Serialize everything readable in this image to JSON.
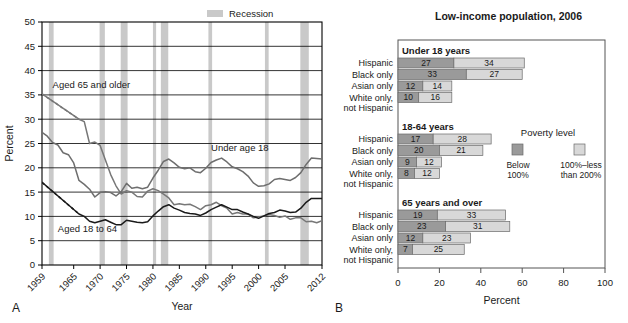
{
  "panel_a": {
    "letter": "A",
    "chart_data": {
      "type": "line",
      "title": "",
      "xlabel": "Year",
      "ylabel": "Percent",
      "ylim": [
        0,
        50
      ],
      "ytick_step": 5,
      "xlim": [
        1959,
        2012
      ],
      "grid": true,
      "xticks": [
        "1959",
        "1965",
        "1970",
        "1975",
        "1980",
        "1985",
        "1990",
        "1995",
        "2000",
        "2005",
        "2012"
      ],
      "xtick_values": [
        1959,
        1965,
        1970,
        1975,
        1980,
        1985,
        1990,
        1995,
        2000,
        2005,
        2012
      ],
      "yticks": [
        0,
        5,
        10,
        15,
        20,
        25,
        30,
        35,
        40,
        45,
        50
      ],
      "legend": [
        {
          "label": "Recession",
          "color": "#c9c9c9"
        }
      ],
      "annotations": [
        {
          "text": "Aged 65 and older",
          "x": 1961,
          "y": 36.5
        },
        {
          "text": "Under age 18",
          "x": 1991,
          "y": 23.5
        },
        {
          "text": "Aged 18 to 64",
          "x": 1962,
          "y": 6.8
        }
      ],
      "recessions": [
        {
          "start": 1960.3,
          "end": 1961.2
        },
        {
          "start": 1969.9,
          "end": 1970.9
        },
        {
          "start": 1973.9,
          "end": 1975.2
        },
        {
          "start": 1980.0,
          "end": 1980.6
        },
        {
          "start": 1981.5,
          "end": 1982.9
        },
        {
          "start": 1990.5,
          "end": 1991.2
        },
        {
          "start": 2001.2,
          "end": 2001.9
        },
        {
          "start": 2007.9,
          "end": 2009.5
        }
      ],
      "series": [
        {
          "name": "Aged 65 and older",
          "color": "#777777",
          "dashed_segments": [
            [
              1959,
              35.2
            ],
            [
              1966,
              30.0
            ]
          ],
          "x": [
            1959,
            1966,
            1967,
            1968,
            1969,
            1970,
            1971,
            1972,
            1973,
            1974,
            1975,
            1976,
            1977,
            1978,
            1979,
            1980,
            1981,
            1982,
            1983,
            1984,
            1985,
            1986,
            1987,
            1988,
            1989,
            1990,
            1991,
            1992,
            1993,
            1994,
            1995,
            1996,
            1997,
            1998,
            1999,
            2000,
            2001,
            2002,
            2003,
            2004,
            2005,
            2006,
            2007,
            2008,
            2009,
            2010,
            2011,
            2012
          ],
          "y": [
            35.2,
            30.0,
            29.5,
            25.0,
            25.3,
            24.6,
            21.6,
            18.6,
            16.3,
            14.6,
            15.3,
            15.0,
            14.1,
            14.0,
            15.2,
            15.7,
            15.3,
            14.6,
            13.8,
            12.4,
            12.6,
            12.4,
            12.5,
            12.0,
            11.4,
            12.2,
            12.4,
            12.9,
            12.2,
            11.7,
            10.5,
            10.8,
            10.5,
            10.5,
            9.7,
            9.9,
            10.1,
            10.4,
            10.2,
            9.8,
            10.1,
            9.4,
            9.7,
            9.7,
            8.9,
            9.0,
            8.7,
            9.1
          ]
        },
        {
          "name": "Under age 18",
          "color": "#6e6e6e",
          "x": [
            1959,
            1960,
            1961,
            1962,
            1963,
            1964,
            1965,
            1966,
            1967,
            1968,
            1969,
            1970,
            1971,
            1972,
            1973,
            1974,
            1975,
            1976,
            1977,
            1978,
            1979,
            1980,
            1981,
            1982,
            1983,
            1984,
            1985,
            1986,
            1987,
            1988,
            1989,
            1990,
            1991,
            1992,
            1993,
            1994,
            1995,
            1996,
            1997,
            1998,
            1999,
            2000,
            2001,
            2002,
            2003,
            2004,
            2005,
            2006,
            2007,
            2008,
            2009,
            2010,
            2011,
            2012
          ],
          "y": [
            27.3,
            26.5,
            25.2,
            24.7,
            23.1,
            22.7,
            21.0,
            17.4,
            16.6,
            15.6,
            14.0,
            14.9,
            15.1,
            14.9,
            14.2,
            15.1,
            16.8,
            15.8,
            16.0,
            15.7,
            16.0,
            17.9,
            19.5,
            21.3,
            21.8,
            21.0,
            20.1,
            19.8,
            20.0,
            19.2,
            19.0,
            19.9,
            21.1,
            21.6,
            22.0,
            21.2,
            20.2,
            19.8,
            19.2,
            18.3,
            16.9,
            16.2,
            16.3,
            16.7,
            17.6,
            17.8,
            17.6,
            17.4,
            18.0,
            19.0,
            20.7,
            22.0,
            21.9,
            21.8
          ]
        },
        {
          "name": "Aged 18 to 64",
          "color": "#1a1a1a",
          "dashed_segments": [
            [
              1959,
              17.0
            ],
            [
              1966,
              10.5
            ]
          ],
          "x": [
            1959,
            1966,
            1967,
            1968,
            1969,
            1970,
            1971,
            1972,
            1973,
            1974,
            1975,
            1976,
            1977,
            1978,
            1979,
            1980,
            1981,
            1982,
            1983,
            1984,
            1985,
            1986,
            1987,
            1988,
            1989,
            1990,
            1991,
            1992,
            1993,
            1994,
            1995,
            1996,
            1997,
            1998,
            1999,
            2000,
            2001,
            2002,
            2003,
            2004,
            2005,
            2006,
            2007,
            2008,
            2009,
            2010,
            2011,
            2012
          ],
          "y": [
            17.0,
            10.5,
            10.0,
            9.0,
            8.7,
            9.0,
            9.3,
            8.8,
            8.3,
            8.3,
            9.2,
            9.0,
            8.8,
            8.7,
            8.9,
            10.1,
            11.1,
            12.0,
            12.4,
            11.7,
            11.3,
            10.8,
            10.6,
            10.5,
            10.2,
            10.7,
            11.4,
            11.9,
            12.4,
            11.9,
            11.4,
            11.4,
            10.9,
            10.5,
            10.0,
            9.6,
            10.1,
            10.6,
            10.8,
            11.3,
            11.1,
            10.8,
            10.9,
            11.7,
            12.9,
            13.7,
            13.7,
            13.7
          ]
        }
      ]
    }
  },
  "panel_b": {
    "letter": "B",
    "chart_data": {
      "type": "bar",
      "title": "Low-income population, 2006",
      "xlabel": "Percent",
      "ylabel": "",
      "xlim": [
        0,
        100
      ],
      "xticks": [
        0,
        20,
        40,
        60,
        80,
        100
      ],
      "xtick_labels": [
        "0",
        "20",
        "40",
        "60",
        "80",
        "100"
      ],
      "orientation": "horizontal",
      "stacked": true,
      "grid": false,
      "legend": {
        "title": "Poverty level",
        "entries": [
          {
            "label": "Below 100%",
            "color": "#9a9a9a"
          },
          {
            "label": "100%–less than 200%",
            "color": "#d8d8d8"
          }
        ]
      },
      "groups": [
        {
          "label": "Under 18 years",
          "categories": [
            "Hispanic",
            "Black only",
            "Asian only",
            "White only, not Hispanic"
          ],
          "series": [
            {
              "name": "Below 100%",
              "values": [
                27,
                33,
                12,
                10
              ]
            },
            {
              "name": "100%–less than 200%",
              "values": [
                34,
                27,
                14,
                16
              ]
            }
          ]
        },
        {
          "label": "18-64 years",
          "categories": [
            "Hispanic",
            "Black only",
            "Asian only",
            "White only, not Hispanic"
          ],
          "series": [
            {
              "name": "Below 100%",
              "values": [
                17,
                20,
                9,
                8
              ]
            },
            {
              "name": "100%–less than 200%",
              "values": [
                28,
                21,
                12,
                12
              ]
            }
          ]
        },
        {
          "label": "65 years and over",
          "categories": [
            "Hispanic",
            "Black only",
            "Asian only",
            "White only, not Hispanic"
          ],
          "series": [
            {
              "name": "Below 100%",
              "values": [
                19,
                23,
                12,
                7
              ]
            },
            {
              "name": "100%–less than 200%",
              "values": [
                33,
                31,
                23,
                25
              ]
            }
          ]
        }
      ]
    }
  }
}
